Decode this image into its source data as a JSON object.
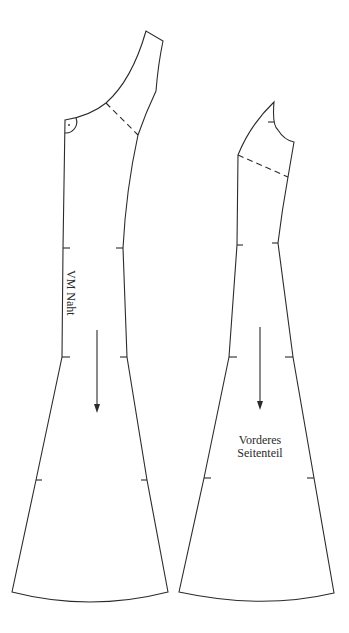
{
  "diagram": {
    "type": "sewing-pattern",
    "stroke_color": "#2b2b2b",
    "background": "#ffffff",
    "pieces": [
      {
        "id": "center-front",
        "label": "VM Naht",
        "label_orientation": "vertical",
        "markings": [
          "right-angle-symbol",
          "dashed-line",
          "grain-arrow",
          "notches"
        ]
      },
      {
        "id": "front-side",
        "label_line1": "Vorderes",
        "label_line2": "Seitenteil",
        "markings": [
          "dashed-line",
          "grain-arrow",
          "notches"
        ]
      }
    ]
  }
}
